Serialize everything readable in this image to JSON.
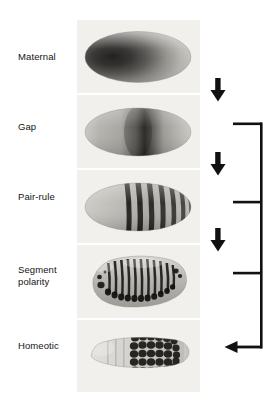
{
  "figure": {
    "background_color": "#ffffff",
    "panel_background": "#f2f0ec",
    "ink_color": "#111111"
  },
  "rows": [
    {
      "id": "maternal",
      "label": "Maternal",
      "label_x": 18,
      "label_y": 56,
      "panel_y": 20,
      "panel_h": 73,
      "specimen": "embryo-gradient-anterior",
      "description": "Whole-mount embryo with graded dark stain strongest at the anterior pole, fading toward posterior"
    },
    {
      "id": "gap",
      "label": "Gap",
      "label_x": 18,
      "label_y": 126,
      "panel_y": 95,
      "panel_h": 73,
      "specimen": "embryo-central-band",
      "description": "Whole-mount embryo with a single broad dark band near the middle of the egg"
    },
    {
      "id": "pair-rule",
      "label": "Pair-rule",
      "label_x": 18,
      "label_y": 196,
      "panel_y": 170,
      "panel_h": 73,
      "specimen": "embryo-seven-stripes",
      "stripe_count": 7,
      "description": "Whole-mount embryo showing seven transverse dark stripes across the posterior two thirds"
    },
    {
      "id": "segment-polarity",
      "label": "Segment\npolarity",
      "label_x": 18,
      "label_y": 264,
      "panel_y": 245,
      "panel_h": 73,
      "specimen": "germ-band-fourteen-stripes",
      "stripe_count": 14,
      "description": "Extended germ band embryo with fourteen narrow dark stripes, one per segment"
    },
    {
      "id": "homeotic",
      "label": "Homeotic",
      "label_x": 18,
      "label_y": 341,
      "panel_y": 320,
      "panel_h": 72,
      "specimen": "larva-posterior-domain",
      "description": "Dorsal view of a larva with dark stain restricted to the posterior segmental domain"
    }
  ],
  "arrows": [
    {
      "name": "arrow-maternal-to-gap",
      "direction": "down",
      "x": 218,
      "y_top": 78,
      "y_bottom": 101
    },
    {
      "name": "arrow-gap-to-pair-rule",
      "direction": "down",
      "x": 218,
      "y_top": 152,
      "y_bottom": 175
    },
    {
      "name": "arrow-pair-rule-to-segment-polarity",
      "direction": "down",
      "x": 218,
      "y_top": 228,
      "y_bottom": 251
    }
  ],
  "bracket": {
    "name": "homeotic-input-bracket",
    "description": "Bracket collecting gap, pair-rule and segment polarity levels and feeding an arrow into the homeotic row",
    "spine_x": 262,
    "spine_top": 124,
    "spine_bottom": 347,
    "arm_x": 233,
    "arms_y": [
      124,
      202,
      273
    ],
    "arrow_y": 347,
    "arrow_tip_x": 225
  }
}
